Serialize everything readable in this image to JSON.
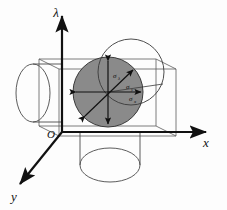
{
  "figure": {
    "background_color": "#fdfdfd",
    "axes": {
      "vertical": {
        "label": "λ",
        "name": "lambda-axis"
      },
      "horizontal": {
        "label": "x",
        "name": "x-axis"
      },
      "depth": {
        "label": "y",
        "name": "y-axis"
      }
    },
    "origin": {
      "label": "O"
    },
    "sphere": {
      "fill_color": "#8a8a8a",
      "stroke_color": "#3a3a3a",
      "center_x": 108,
      "center_y": 92,
      "radius": 35
    },
    "offset_circle": {
      "stroke_color": "#3a3a3a",
      "center_x": 131,
      "center_y": 72,
      "radius": 33
    },
    "sigma_arrows": [
      {
        "label": "σ",
        "subscript": "λ",
        "name": "sigma-lambda-arrow",
        "direction": "vertical",
        "label_x": 114,
        "label_y": 77
      },
      {
        "label": "σ",
        "subscript": "y",
        "name": "sigma-y-arrow",
        "direction": "diagonal",
        "label_x": 127,
        "label_y": 88
      },
      {
        "label": "σ",
        "subscript": "x",
        "name": "sigma-x-arrow",
        "direction": "horizontal",
        "label_x": 131,
        "label_y": 100
      }
    ],
    "wireframe": {
      "stroke_color": "#4a4a4a",
      "left_cylinder_label": "left-cylinder",
      "bottom_cylinder_label": "bottom-cylinder",
      "box_label": "projection-box"
    }
  }
}
